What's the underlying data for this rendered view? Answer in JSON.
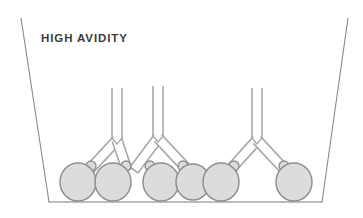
{
  "figure": {
    "title": "HIGH AVIDITY",
    "kind": "immunoassay-well-schematic"
  },
  "colors": {
    "background": "#ffffff",
    "well_wall_stroke": "#8a8a8a",
    "well_floor_stroke": "#7a7a7a",
    "antigen_fill": "#dcdcdc",
    "antigen_stroke": "#8f8f8f",
    "antibody_fill": "#ffffff",
    "antibody_stroke": "#a8a8a8",
    "title_text": "#3b3b3b"
  },
  "well": {
    "label": "assay-well-outline",
    "left_wall": {
      "x1": 21,
      "y1": 18,
      "x2": 49,
      "y2": 202
    },
    "floor": {
      "x1": 49,
      "y1": 202,
      "x2": 322,
      "y2": 202
    },
    "right_wall": {
      "x1": 322,
      "y1": 202,
      "x2": 348,
      "y2": 18
    },
    "stroke_width": 1.1
  },
  "antigens": [
    {
      "id": "antigen-1",
      "cx": 78,
      "cy": 182,
      "r": 18,
      "epitope": {
        "cx": 91,
        "cy": 166,
        "r": 5
      }
    },
    {
      "id": "antigen-2",
      "cx": 113,
      "cy": 182,
      "r": 18,
      "epitope": {
        "cx": 126,
        "cy": 166,
        "r": 5
      }
    },
    {
      "id": "antigen-3",
      "cx": 161,
      "cy": 182,
      "r": 18,
      "epitope": {
        "cx": 150,
        "cy": 166,
        "r": 5
      }
    },
    {
      "id": "antigen-4",
      "cx": 193,
      "cy": 182,
      "r": 17,
      "epitope": {
        "cx": 183,
        "cy": 166,
        "r": 5
      }
    },
    {
      "id": "antigen-5",
      "cx": 221,
      "cy": 182,
      "r": 18,
      "epitope": {
        "cx": 234,
        "cy": 166,
        "r": 5
      }
    },
    {
      "id": "antigen-6",
      "cx": 294,
      "cy": 182,
      "r": 18,
      "epitope": {
        "cx": 284,
        "cy": 166,
        "r": 5
      }
    }
  ],
  "antibodies": [
    {
      "id": "antibody-1",
      "hinge_x": 117,
      "stem_top_y": 88,
      "hinge_y": 140,
      "left_tip": {
        "x": 89,
        "y": 170
      },
      "right_tip": {
        "x": 127,
        "y": 170
      }
    },
    {
      "id": "antibody-2",
      "hinge_x": 158,
      "stem_top_y": 86,
      "hinge_y": 138,
      "left_tip": {
        "x": 134,
        "y": 170
      },
      "right_tip": {
        "x": 186,
        "y": 168
      }
    },
    {
      "id": "antibody-3",
      "hinge_x": 257,
      "stem_top_y": 88,
      "hinge_y": 140,
      "left_tip": {
        "x": 230,
        "y": 170
      },
      "right_tip": {
        "x": 285,
        "y": 170
      }
    }
  ],
  "caption_note": {
    "binding_mode": "bivalent",
    "antigen_count": 6,
    "antibody_count": 3
  }
}
